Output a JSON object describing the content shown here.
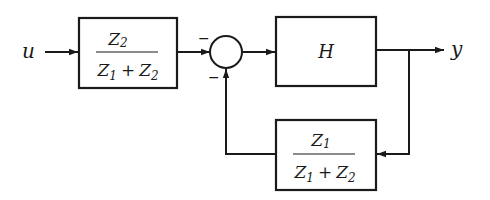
{
  "diagram": {
    "input_label": "u",
    "output_label": "y",
    "forward_block": {
      "numerator": "Z",
      "numerator_sub": "2",
      "denominator_a": "Z",
      "denominator_a_sub": "1",
      "denominator_op": "+",
      "denominator_b": "Z",
      "denominator_b_sub": "2"
    },
    "summing_junction": {
      "input_top_sign": "−",
      "input_bottom_sign": "−"
    },
    "plant_block": {
      "label": "H"
    },
    "feedback_block": {
      "numerator": "Z",
      "numerator_sub": "1",
      "denominator_a": "Z",
      "denominator_a_sub": "1",
      "denominator_op": "+",
      "denominator_b": "Z",
      "denominator_b_sub": "2"
    },
    "colors": {
      "stroke": "#1a1a1a",
      "background": "#ffffff"
    }
  }
}
